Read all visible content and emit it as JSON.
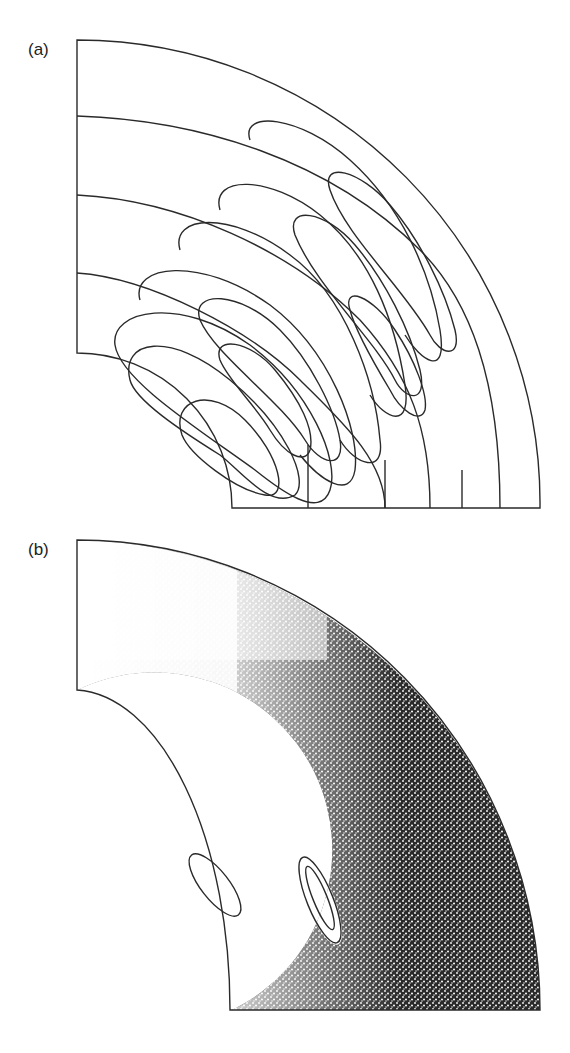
{
  "figure": {
    "panels": [
      {
        "label": "(a)",
        "description": "Streamline contours in annular quarter sector"
      },
      {
        "label": "(b)",
        "description": "Poincaré section scatter in annular quarter sector with two KAM islands"
      }
    ]
  },
  "colors": {
    "line": "#2a2a2a",
    "dots": "#1a1a1a",
    "background": "#ffffff"
  }
}
